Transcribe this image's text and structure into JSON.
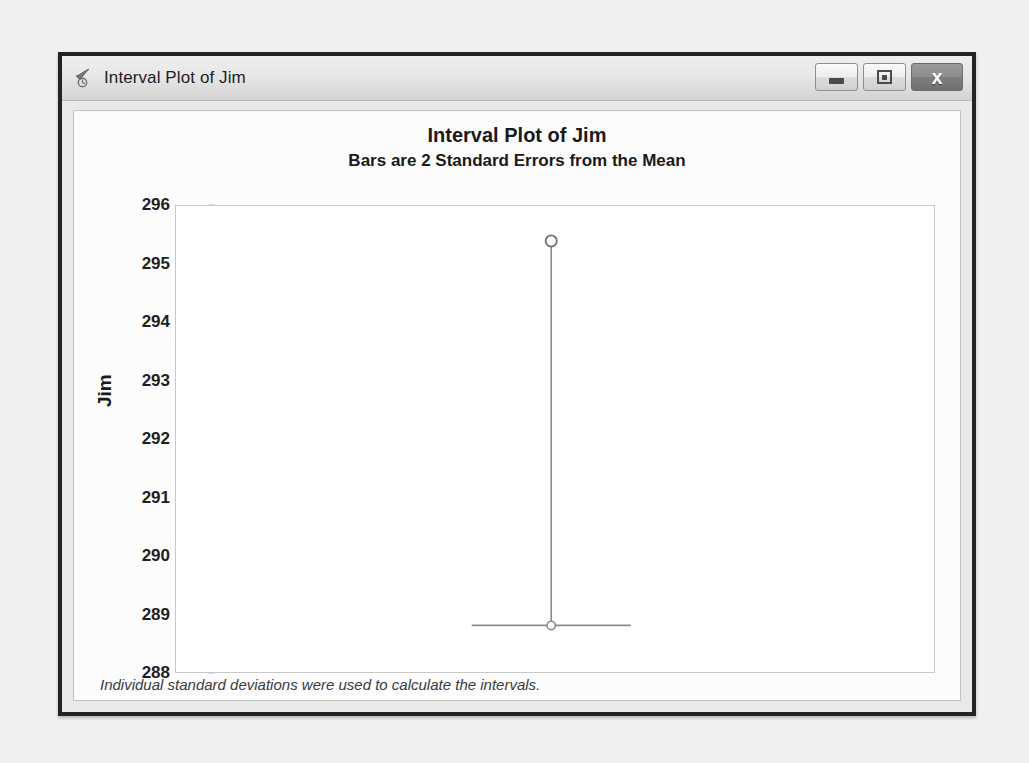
{
  "window": {
    "title": "Interval Plot of Jim",
    "icon": "minitab-graph-icon",
    "buttons": {
      "minimize": "Minimize",
      "maximize": "Maximize",
      "close": "x"
    }
  },
  "chart_data": {
    "type": "scatter",
    "title": "Interval Plot of Jim",
    "subtitle": "Bars are 2 Standard Errors from the Mean",
    "xlabel": "",
    "ylabel": "Jim",
    "ylim": [
      288,
      296
    ],
    "yticks": [
      296,
      295,
      294,
      293,
      292,
      291,
      290,
      289,
      288
    ],
    "grid": false,
    "legend": null,
    "footnote": "Individual standard deviations were used to calculate the intervals.",
    "categories": [
      "Jim"
    ],
    "series": [
      {
        "name": "Mean",
        "marker": "open-circle",
        "values": [
          295.4
        ]
      },
      {
        "name": "Interval lower bound",
        "marker": "open-circle-with-cap",
        "values": [
          288.8
        ]
      }
    ],
    "interval": {
      "center_x_fraction": 0.495,
      "mean": 295.4,
      "lower": 288.8,
      "cap_halfwidth_fraction": 0.105,
      "line_color": "#8a8a8a"
    }
  }
}
